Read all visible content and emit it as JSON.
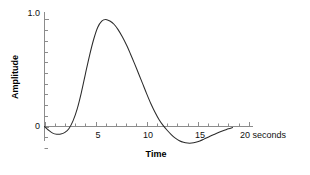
{
  "chart_data": {
    "type": "line",
    "title": "",
    "subtitle": "",
    "xlabel": "Time",
    "ylabel": "Amplitude",
    "xunit": "seconds",
    "grid": false,
    "legend": false,
    "legend_position": "none",
    "xlim": [
      0,
      20.4
    ],
    "ylim": [
      -0.26,
      1.06
    ],
    "xticks": [
      0,
      1,
      2,
      3,
      4,
      5,
      6,
      7,
      8,
      9,
      10,
      11,
      12,
      13,
      14,
      15,
      16,
      17,
      18,
      19,
      20
    ],
    "xtick_labels": [
      {
        "value": 0,
        "label": "0"
      },
      {
        "value": 5,
        "label": "5"
      },
      {
        "value": 10,
        "label": "10"
      },
      {
        "value": 15,
        "label": "15"
      },
      {
        "value": 20,
        "label": "20 seconds"
      }
    ],
    "yticks": [
      0,
      0.1,
      0.2,
      0.3,
      0.4,
      0.5,
      0.6,
      0.7,
      0.8,
      0.9,
      1.0
    ],
    "ytick_labels": [
      {
        "value": 0,
        "label": "0"
      },
      {
        "value": 1.0,
        "label": "1.0"
      }
    ],
    "line_color": "#2b2b2b",
    "axis_color": "#8c8c8c",
    "background_color": "#ffffff",
    "series": [
      {
        "name": "amplitude",
        "x": [
          0.0,
          0.4,
          0.8,
          1.2,
          1.6,
          2.0,
          2.4,
          2.8,
          3.2,
          3.6,
          4.0,
          4.4,
          4.8,
          5.2,
          5.6,
          6.0,
          6.4,
          6.8,
          7.2,
          7.6,
          8.0,
          8.4,
          8.8,
          9.2,
          9.6,
          10.0,
          10.4,
          10.8,
          11.2,
          11.6,
          12.0,
          12.4,
          12.8,
          13.2,
          13.6,
          14.0,
          14.4,
          14.8,
          15.2,
          15.6,
          16.0,
          16.4,
          16.8,
          17.2,
          17.6,
          18.0,
          18.4
        ],
        "y": [
          0.0,
          -0.035,
          -0.062,
          -0.072,
          -0.071,
          -0.055,
          -0.018,
          0.055,
          0.165,
          0.315,
          0.49,
          0.66,
          0.81,
          0.925,
          0.985,
          1.0,
          0.985,
          0.955,
          0.905,
          0.84,
          0.765,
          0.68,
          0.59,
          0.495,
          0.4,
          0.305,
          0.215,
          0.135,
          0.065,
          0.01,
          -0.035,
          -0.075,
          -0.108,
          -0.133,
          -0.148,
          -0.155,
          -0.155,
          -0.148,
          -0.135,
          -0.118,
          -0.1,
          -0.082,
          -0.065,
          -0.05,
          -0.036,
          -0.022,
          -0.01
        ]
      }
    ]
  },
  "labels": {
    "ylabel": "Amplitude",
    "xlabel": "Time",
    "ytick_top": "1.0",
    "ytick_bottom": "0",
    "xtick_5": "5",
    "xtick_10": "10",
    "xtick_15": "15",
    "xtick_20": "20 seconds"
  }
}
